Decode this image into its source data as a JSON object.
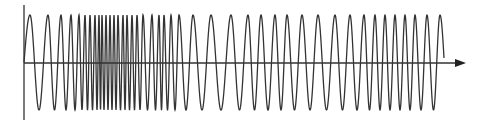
{
  "diagram": {
    "type": "waveform",
    "colors": {
      "wave": "#333333",
      "axis": "#333333",
      "background": "#ffffff"
    },
    "axes": {
      "y_axis": {
        "x": 24,
        "y_top": 5,
        "y_bottom": 120
      },
      "x_axis": {
        "y": 63,
        "x_start": 24,
        "x_end": 466,
        "arrow": true
      }
    },
    "wave": {
      "baseline_y": 63,
      "peak_y": 15,
      "trough_y": 110,
      "start_x": 24,
      "end_x": 444,
      "end_y": 58,
      "peak_x": [
        30,
        48,
        61,
        71,
        79,
        85,
        90,
        95,
        99,
        102,
        106,
        110,
        114,
        118,
        123,
        127,
        132,
        137,
        143,
        152,
        159,
        164,
        171,
        179,
        193,
        211,
        231,
        248,
        261,
        275,
        287,
        302,
        318,
        335,
        350,
        364,
        375,
        385,
        395,
        405,
        415,
        427,
        440
      ]
    }
  }
}
